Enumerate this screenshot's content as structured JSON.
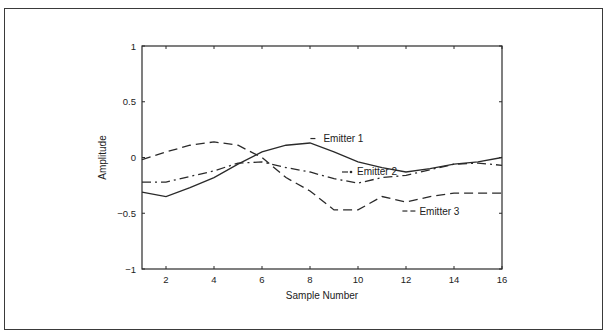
{
  "chart_data": {
    "type": "line",
    "title": "",
    "xlabel": "Sample Number",
    "ylabel": "Amplitude",
    "xlim": [
      1,
      16
    ],
    "ylim": [
      -1,
      1
    ],
    "grid": false,
    "x_ticks": [
      2,
      4,
      6,
      8,
      10,
      12,
      14,
      16
    ],
    "x_tick_labels": [
      "2",
      "4",
      "6",
      "8",
      "10",
      "12",
      "14",
      "16"
    ],
    "y_ticks": [
      1,
      0.5,
      0,
      -0.5,
      -1
    ],
    "y_tick_labels": [
      "1",
      "0.5",
      "0",
      "−0.5",
      "−1"
    ],
    "x": [
      1,
      2,
      3,
      4,
      5,
      6,
      7,
      8,
      9,
      10,
      11,
      12,
      13,
      14,
      15,
      16
    ],
    "series": [
      {
        "name": "Emitter 1",
        "style": "solid",
        "values": [
          -0.31,
          -0.35,
          -0.27,
          -0.18,
          -0.06,
          0.05,
          0.11,
          0.13,
          0.05,
          -0.04,
          -0.09,
          -0.13,
          -0.1,
          -0.06,
          -0.04,
          0.0
        ]
      },
      {
        "name": "Emitter 2",
        "style": "dashdot",
        "values": [
          -0.22,
          -0.22,
          -0.17,
          -0.12,
          -0.05,
          -0.04,
          -0.09,
          -0.13,
          -0.19,
          -0.23,
          -0.18,
          -0.16,
          -0.11,
          -0.06,
          -0.05,
          -0.07
        ]
      },
      {
        "name": "Emitter 3",
        "style": "dashed",
        "values": [
          -0.02,
          0.05,
          0.11,
          0.14,
          0.11,
          0.0,
          -0.18,
          -0.3,
          -0.47,
          -0.47,
          -0.35,
          -0.4,
          -0.35,
          -0.32,
          -0.32,
          -0.32
        ]
      }
    ],
    "annotations": [
      {
        "text": "Emitter 1",
        "series": "Emitter 1",
        "near_x": 8.6,
        "near_y": 0.17
      },
      {
        "text": "Emitter 2",
        "series": "Emitter 2",
        "near_x": 10.0,
        "near_y": -0.13
      },
      {
        "text": "Emitter 3",
        "series": "Emitter 3",
        "near_x": 12.6,
        "near_y": -0.48
      }
    ],
    "colors": {
      "line": "#2a2a2a",
      "axis": "#2a2a2a",
      "frame": "#3a3a3a",
      "background": "#ffffff"
    }
  }
}
